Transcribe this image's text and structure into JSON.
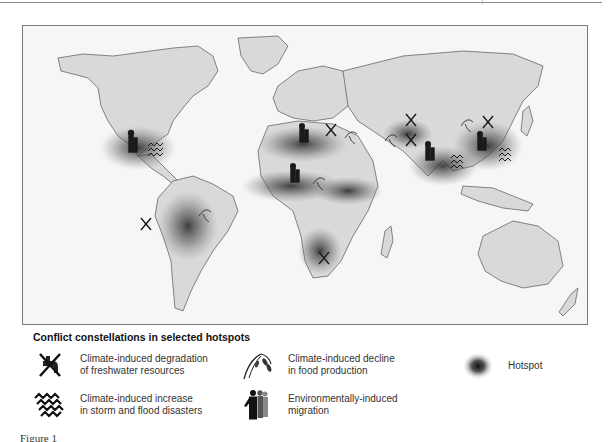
{
  "map": {
    "title": "World map of climate-induced conflict constellations",
    "hotspots": [
      {
        "name": "Central America / Gulf of Mexico",
        "icons": [
          "migration",
          "storm-flood"
        ]
      },
      {
        "name": "Andes / Amazon",
        "icons": [
          "freshwater",
          "food-decline"
        ]
      },
      {
        "name": "North Africa / Sahara",
        "icons": [
          "migration",
          "freshwater",
          "food-decline"
        ]
      },
      {
        "name": "Sahel",
        "icons": [
          "migration",
          "food-decline"
        ]
      },
      {
        "name": "Horn of Africa",
        "icons": []
      },
      {
        "name": "Southern Africa",
        "icons": [
          "food-decline",
          "freshwater"
        ]
      },
      {
        "name": "Central Asia",
        "icons": [
          "freshwater"
        ]
      },
      {
        "name": "South Asia / India",
        "icons": [
          "freshwater",
          "migration",
          "storm-flood",
          "food-decline"
        ]
      },
      {
        "name": "China",
        "icons": [
          "freshwater",
          "food-decline",
          "migration",
          "storm-flood"
        ]
      }
    ]
  },
  "legend": {
    "title": "Conflict constellations in selected hotspots",
    "items": [
      {
        "icon": "freshwater-degradation-icon",
        "line1": "Climate-induced degradation",
        "line2": "of freshwater resources"
      },
      {
        "icon": "food-decline-icon",
        "line1": "Climate-induced decline",
        "line2": "in food production"
      },
      {
        "icon": "hotspot-icon",
        "line1": "Hotspot",
        "line2": ""
      },
      {
        "icon": "storm-flood-icon",
        "line1": "Climate-induced increase",
        "line2": "in storm and flood disasters"
      },
      {
        "icon": "migration-icon",
        "line1": "Environmentally-induced",
        "line2": "migration"
      }
    ]
  },
  "caption": {
    "text": "Figure 1"
  },
  "colors": {
    "land": "#d9d9d9",
    "ocean": "#f6f6f6",
    "border": "#555555",
    "hotspot": "#333333",
    "icon": "#1a1a1a"
  }
}
